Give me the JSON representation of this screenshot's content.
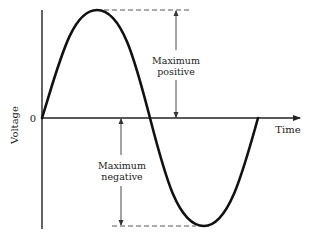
{
  "diagram": {
    "type": "sine-wave-voltage",
    "axes": {
      "y_label": "Voltage",
      "x_label": "Time",
      "origin_label": "0"
    },
    "annotations": {
      "max_positive": {
        "line1": "Maximum",
        "line2": "positive"
      },
      "max_negative": {
        "line1": "Maximum",
        "line2": "negative"
      }
    },
    "colors": {
      "curve": "#111111",
      "axis": "#222222",
      "dashed": "#555555",
      "text": "#222222",
      "background": "#ffffff"
    }
  }
}
